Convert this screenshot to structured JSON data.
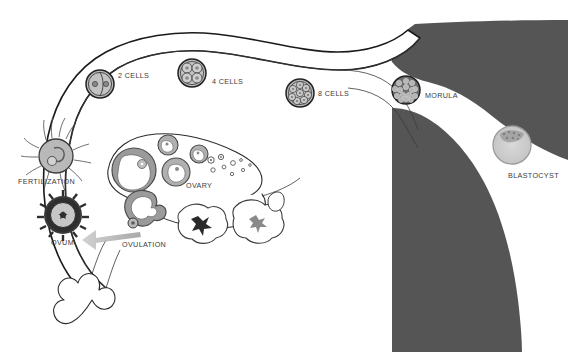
{
  "figure": {
    "background_color": "#ffffff",
    "line_color": "#1a1a1a",
    "uterus_fill": "#555555",
    "cell_fill": "#b9b9b9",
    "label_color": "#3a3a3a"
  },
  "labels": {
    "fertilization": "FERTILIZATION",
    "ovum": "OVUM",
    "ovulation": "OVULATION",
    "ovary": "OVARY",
    "two_cells": "2 CELLS",
    "four_cells": "4 CELLS",
    "eight_cells": "8 CELLS",
    "morula": "MORULA",
    "blastocyst": "BLASTOCYST"
  },
  "stages": [
    {
      "name": "fertilization",
      "label": "FERTILIZATION",
      "cell_count": 1,
      "x": 55,
      "y": 152
    },
    {
      "name": "ovum",
      "label": "OVUM",
      "cell_count": 1,
      "x": 63,
      "y": 215
    },
    {
      "name": "ovulation",
      "label": "OVULATION",
      "cell_count": 1,
      "x": 145,
      "y": 226
    },
    {
      "name": "two-cells",
      "label": "2 CELLS",
      "cell_count": 2,
      "x": 100,
      "y": 84
    },
    {
      "name": "four-cells",
      "label": "4 CELLS",
      "cell_count": 4,
      "x": 192,
      "y": 73
    },
    {
      "name": "eight-cells",
      "label": "8 CELLS",
      "cell_count": 8,
      "x": 300,
      "y": 93
    },
    {
      "name": "morula",
      "label": "MORULA",
      "cell_count": 32,
      "x": 406,
      "y": 90
    },
    {
      "name": "blastocyst",
      "label": "BLASTOCYST",
      "cell_count": 64,
      "x": 512,
      "y": 145
    }
  ],
  "anatomy": {
    "fallopian_tube": "fallopian-tube",
    "uterus": "uterus",
    "ovary": "ovary",
    "fimbriae": "fimbriae",
    "corpus_luteum": "corpus-luteum",
    "antral_follicle": "antral-follicle",
    "primordial_follicles": "primordial-follicles",
    "ovulation_arrow": "ovulation-arrow"
  }
}
